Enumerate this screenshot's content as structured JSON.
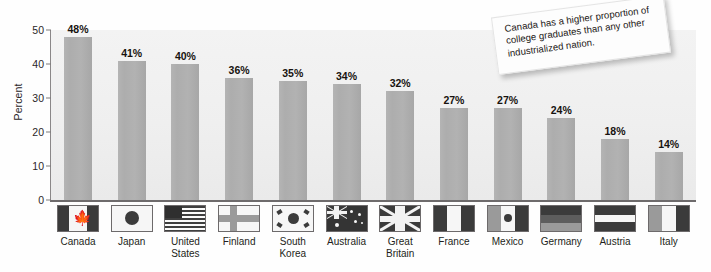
{
  "chart_data": {
    "type": "bar",
    "title": "",
    "subtitle": "",
    "xlabel": "",
    "ylabel": "Percent",
    "ylim": [
      0,
      50
    ],
    "yticks": [
      0,
      10,
      20,
      30,
      40,
      50
    ],
    "grid": false,
    "legend": false,
    "value_label_suffix": "%",
    "categories": [
      "Canada",
      "Japan",
      "United States",
      "Finland",
      "South Korea",
      "Australia",
      "Great Britain",
      "France",
      "Mexico",
      "Germany",
      "Austria",
      "Italy"
    ],
    "values": [
      48,
      41,
      40,
      36,
      35,
      34,
      32,
      27,
      27,
      24,
      18,
      14
    ],
    "value_labels": [
      "48%",
      "41%",
      "40%",
      "36%",
      "35%",
      "34%",
      "32%",
      "27%",
      "27%",
      "24%",
      "18%",
      "14%"
    ],
    "annotations": [
      {
        "name": "callout-note",
        "text": "Canada has a higher proportion of college graduates than any other industrialized nation."
      }
    ],
    "colors": {
      "bar": "#adadad",
      "plot_background": "#efefef",
      "axis": "#6e6b6c",
      "text": "#231f20",
      "note_background": "#fdfdfd"
    }
  },
  "axis": {
    "y_title": "Percent",
    "tick_labels": [
      "50",
      "40",
      "30",
      "20",
      "10",
      "0"
    ]
  },
  "categories": [
    {
      "label_line1": "Canada",
      "label_line2": "",
      "flag": "flag-canada"
    },
    {
      "label_line1": "Japan",
      "label_line2": "",
      "flag": "flag-japan"
    },
    {
      "label_line1": "United",
      "label_line2": "States",
      "flag": "flag-united-states"
    },
    {
      "label_line1": "Finland",
      "label_line2": "",
      "flag": "flag-finland"
    },
    {
      "label_line1": "South",
      "label_line2": "Korea",
      "flag": "flag-south-korea"
    },
    {
      "label_line1": "Australia",
      "label_line2": "",
      "flag": "flag-australia"
    },
    {
      "label_line1": "Great",
      "label_line2": "Britain",
      "flag": "flag-great-britain"
    },
    {
      "label_line1": "France",
      "label_line2": "",
      "flag": "flag-france"
    },
    {
      "label_line1": "Mexico",
      "label_line2": "",
      "flag": "flag-mexico"
    },
    {
      "label_line1": "Germany",
      "label_line2": "",
      "flag": "flag-germany"
    },
    {
      "label_line1": "Austria",
      "label_line2": "",
      "flag": "flag-austria"
    },
    {
      "label_line1": "Italy",
      "label_line2": "",
      "flag": "flag-italy"
    }
  ],
  "callout": {
    "text": "Canada has a higher proportion of college graduates than any other industrialized nation."
  }
}
